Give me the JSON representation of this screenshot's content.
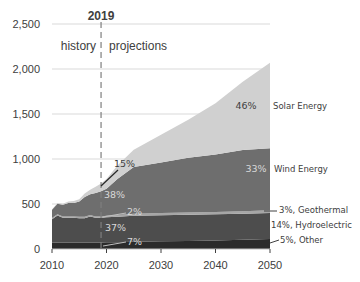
{
  "chart_data": {
    "type": "area",
    "stacked": true,
    "title": "",
    "xlabel": "",
    "ylabel": "",
    "ylim": [
      0,
      2500
    ],
    "xlim": [
      2010,
      2050
    ],
    "grid": true,
    "y_ticks": [
      "0",
      "500",
      "1,000",
      "1,500",
      "2,000",
      "2,500"
    ],
    "y_tick_values": [
      0,
      500,
      1000,
      1500,
      2000,
      2500
    ],
    "x_ticks": [
      "2010",
      "2020",
      "2030",
      "2040",
      "2050"
    ],
    "x_tick_values": [
      2010,
      2020,
      2030,
      2040,
      2050
    ],
    "x": [
      2010,
      2011,
      2012,
      2013,
      2014,
      2015,
      2016,
      2017,
      2018,
      2019,
      2020,
      2022,
      2025,
      2030,
      2035,
      2040,
      2045,
      2050
    ],
    "series": [
      {
        "name": "Other",
        "color": "#2b2b2b",
        "values": [
          70,
          72,
          72,
          72,
          72,
          72,
          72,
          72,
          72,
          72,
          74,
          76,
          80,
          85,
          90,
          95,
          102,
          110
        ]
      },
      {
        "name": "Hydroelectric",
        "color": "#4d4d4d",
        "values": [
          260,
          300,
          275,
          275,
          275,
          270,
          270,
          290,
          275,
          275,
          278,
          282,
          290,
          290,
          290,
          290,
          290,
          290
        ]
      },
      {
        "name": "Geothermal",
        "color": "#a6a6a6",
        "values": [
          15,
          15,
          15,
          15,
          15,
          15,
          15,
          15,
          15,
          15,
          17,
          20,
          22,
          25,
          25,
          25,
          27,
          30
        ]
      },
      {
        "name": "Wind Energy",
        "color": "#6e6e6e",
        "values": [
          90,
          115,
          130,
          150,
          150,
          170,
          220,
          230,
          260,
          280,
          300,
          400,
          520,
          560,
          610,
          640,
          680,
          690
        ]
      },
      {
        "name": "Solar Energy",
        "color": "#d0d0d0",
        "values": [
          5,
          8,
          10,
          15,
          20,
          25,
          40,
          50,
          70,
          85,
          110,
          150,
          190,
          310,
          420,
          570,
          760,
          950
        ]
      }
    ],
    "annotations": {
      "divider_year": 2019,
      "divider_label": "2019",
      "history_label": "history",
      "projections_label": "projections",
      "inner_labels": [
        {
          "text": "15%",
          "series": "Solar Energy",
          "year": 2019
        },
        {
          "text": "38%",
          "series": "Wind Energy",
          "year": 2019
        },
        {
          "text": "2%",
          "series": "Geothermal",
          "year": 2019
        },
        {
          "text": "37%",
          "series": "Hydroelectric",
          "year": 2019
        },
        {
          "text": "7%",
          "series": "Other",
          "year": 2019
        },
        {
          "text": "46%",
          "series": "Solar Energy",
          "year": 2050
        },
        {
          "text": "33%",
          "series": "Wind Energy",
          "year": 2050
        }
      ],
      "right_labels": [
        {
          "text": "Solar Energy",
          "series": "Solar Energy"
        },
        {
          "text": "Wind Energy",
          "series": "Wind Energy"
        },
        {
          "text": "3%, Geothermal",
          "series": "Geothermal"
        },
        {
          "text": "14%, Hydroelectric",
          "series": "Hydroelectric"
        },
        {
          "text": "5%, Other",
          "series": "Other"
        }
      ]
    }
  }
}
